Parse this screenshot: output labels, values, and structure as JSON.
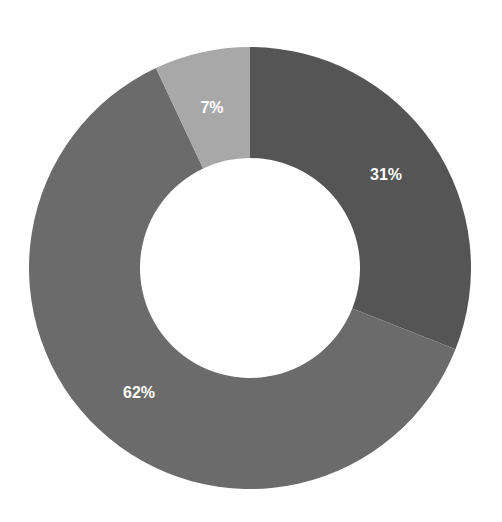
{
  "chart_data": {
    "type": "pie",
    "variant": "donut",
    "title": "",
    "categories": [
      "Segment A",
      "Segment B",
      "Segment C"
    ],
    "values": [
      31,
      62,
      7
    ],
    "labels": [
      "31%",
      "62%",
      "7%"
    ],
    "colors": [
      "#555555",
      "#6b6b6b",
      "#a8a8a8"
    ],
    "start_angle_deg": 0,
    "direction": "clockwise",
    "legend": "none",
    "data_label_color": "#ffffff"
  },
  "layout": {
    "width": 502,
    "height": 522,
    "center_x": 250,
    "center_y": 268,
    "outer_radius": 221,
    "inner_radius": 110,
    "label_positions": [
      {
        "x": 386,
        "y": 176
      },
      {
        "x": 139,
        "y": 394
      },
      {
        "x": 212,
        "y": 109
      }
    ]
  }
}
